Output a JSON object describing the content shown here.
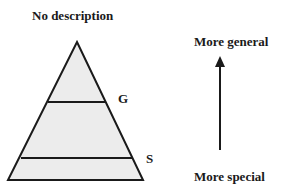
{
  "diagram": {
    "title": "No description",
    "levels": [
      {
        "label": "G",
        "position": "general-level-line"
      },
      {
        "label": "S",
        "position": "special-level-line"
      }
    ],
    "arrow": {
      "top_label": "More general",
      "bottom_label": "More special",
      "direction": "up"
    },
    "colors": {
      "pyramid_fill": "#ececec",
      "stroke": "#1a1a1a",
      "text": "#1a1a1a"
    }
  }
}
